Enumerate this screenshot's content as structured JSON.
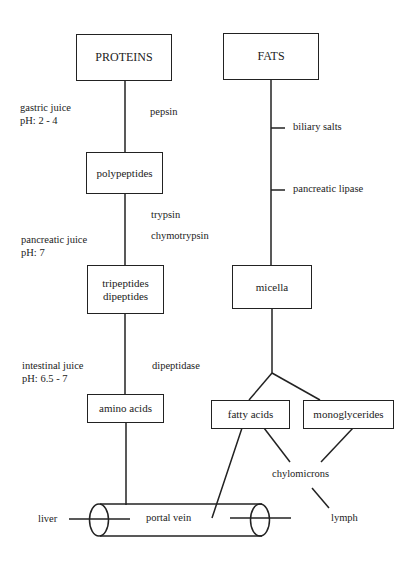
{
  "diagram": {
    "title_boxes": {
      "proteins": "PROTEINS",
      "fats": "FATS"
    },
    "protein_pathway": {
      "stages": [
        {
          "id": "polypeptides",
          "label": "polypeptides"
        },
        {
          "id": "tripeptides",
          "lines": [
            "tripeptides",
            "dipeptides"
          ]
        },
        {
          "id": "amino-acids",
          "label": "amino acids"
        }
      ],
      "juices": [
        {
          "name": "gastric juice",
          "ph": "pH: 2 - 4"
        },
        {
          "name": "pancreatic juice",
          "ph": "pH: 7"
        },
        {
          "name": "intestinal juice",
          "ph": "pH: 6.5 - 7"
        }
      ],
      "enzymes": {
        "step1": "pepsin",
        "step2a": "trypsin",
        "step2b": "chymotrypsin",
        "step3": "dipeptidase"
      }
    },
    "fat_pathway": {
      "agents": [
        "biliary salts",
        "pancreatic lipase"
      ],
      "micella": "micella",
      "products": [
        "fatty acids",
        "monoglycerides"
      ],
      "chylomicrons": "chylomicrons"
    },
    "circulation": {
      "portal_vein": "portal vein",
      "liver": "liver",
      "lymph": "lymph"
    }
  }
}
